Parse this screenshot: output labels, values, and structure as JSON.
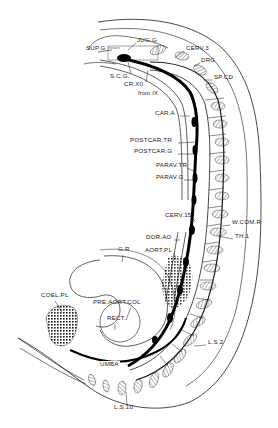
{
  "figure": {
    "ink_color": "#1a1a1a",
    "background": "#ffffff",
    "labels": [
      {
        "id": "jug_g",
        "text": "JUG.G",
        "x": 137,
        "y": 40
      },
      {
        "id": "sup_g",
        "text": "SUP.G",
        "x": 86,
        "y": 48
      },
      {
        "id": "cerv_3",
        "text": "CERV.3",
        "x": 186,
        "y": 48
      },
      {
        "id": "drg",
        "text": "DRG",
        "x": 201,
        "y": 60
      },
      {
        "id": "s_c_g",
        "text": "S.C.G.",
        "x": 110,
        "y": 76
      },
      {
        "id": "sp_cd",
        "text": "SP.CD",
        "x": 214,
        "y": 77
      },
      {
        "id": "cr_xii",
        "text": "CR.XII",
        "x": 124,
        "y": 84
      },
      {
        "id": "from_ix",
        "text": "from IX",
        "x": 138,
        "y": 94
      },
      {
        "id": "car_a",
        "text": "CAR.A",
        "x": 155,
        "y": 113
      },
      {
        "id": "postcar_tr",
        "text": "POSTCAR.TR",
        "x": 130,
        "y": 140
      },
      {
        "id": "postcar_g",
        "text": "POSTCAR.G",
        "x": 134,
        "y": 151
      },
      {
        "id": "parav_tr",
        "text": "PARAV.TR",
        "x": 156,
        "y": 165
      },
      {
        "id": "parav_g",
        "text": "PARAV.G",
        "x": 156,
        "y": 177
      },
      {
        "id": "cerv_15",
        "text": "CERV.15",
        "x": 165,
        "y": 215
      },
      {
        "id": "w_com_r",
        "text": "W.COM.R",
        "x": 232,
        "y": 222
      },
      {
        "id": "dor_ao",
        "text": "DOR.AO",
        "x": 146,
        "y": 237
      },
      {
        "id": "th_1",
        "text": "TH.1",
        "x": 235,
        "y": 236
      },
      {
        "id": "aort_pl",
        "text": "AORT.PL",
        "x": 145,
        "y": 250
      },
      {
        "id": "gr",
        "text": "G.R",
        "x": 118,
        "y": 249
      },
      {
        "id": "coel_pl",
        "text": "COEL.PL",
        "x": 41,
        "y": 295
      },
      {
        "id": "pre_aort_col",
        "text": "PRE.AORT.COL",
        "x": 93,
        "y": 302
      },
      {
        "id": "rect",
        "text": "RECT.",
        "x": 107,
        "y": 318
      },
      {
        "id": "l_s_2",
        "text": "L.S.2",
        "x": 208,
        "y": 342
      },
      {
        "id": "umba",
        "text": "UMBA",
        "x": 99,
        "y": 364
      },
      {
        "id": "l_s_10",
        "text": "L.S.10",
        "x": 114,
        "y": 407
      }
    ]
  }
}
